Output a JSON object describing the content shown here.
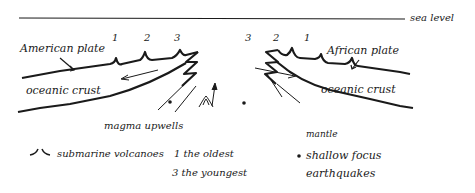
{
  "diagram": {
    "type": "mid-ocean ridge cross-section",
    "labels": {
      "sea_level": "sea level",
      "american_plate": "American plate",
      "african_plate": "African plate",
      "oceanic_crust_left": "oceanic crust",
      "oceanic_crust_right": "oceanic crust",
      "magma_upwells": "magma upwells",
      "mantle": "mantle"
    },
    "volcano_numbers_left": [
      "1",
      "2",
      "3"
    ],
    "volcano_numbers_right": [
      "3",
      "2",
      "1"
    ],
    "legend": {
      "volcano_symbol": "⌣",
      "volcanoes": "submarine volcanoes",
      "oldest": "1 the oldest",
      "youngest": "3 the youngest",
      "quake_symbol": "✱",
      "quakes_line1": "shallow focus",
      "quakes_line2": "earthquakes"
    },
    "colors": {
      "ink": "#1a1a1a",
      "background": "#ffffff"
    }
  }
}
